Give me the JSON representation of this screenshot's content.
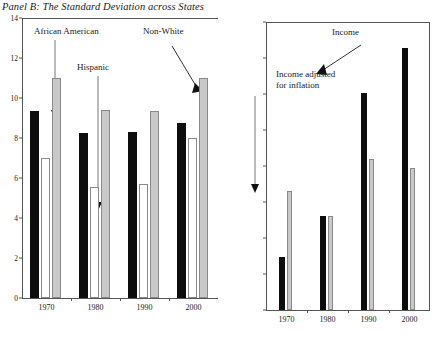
{
  "panels": {
    "left": {
      "title": "Panel B: The Standard Deviation across States",
      "annotations": {
        "african_american": "African American",
        "hispanic": "Hispanic",
        "non_white": "Non-White"
      }
    },
    "right": {
      "annotations": {
        "income": "Income",
        "income_adjusted_l1": "Income adjusted",
        "income_adjusted_l2": "for inflation"
      }
    }
  },
  "chart_data": [
    {
      "type": "bar",
      "title": "Panel B: The Standard Deviation across States",
      "xlabel": "",
      "ylabel": "",
      "ylim": [
        0,
        14
      ],
      "yticks": [
        0,
        2,
        4,
        6,
        8,
        10,
        12,
        14
      ],
      "ytick_labels": [
        "0",
        "2",
        "4",
        "6",
        "8",
        "10",
        "12",
        "14"
      ],
      "grid": false,
      "legend": "annotated-arrows",
      "categories": [
        "1970",
        "1980",
        "1990",
        "2000"
      ],
      "series": [
        {
          "name": "African American",
          "color": "#0d0d0d",
          "values": [
            9.35,
            8.25,
            8.3,
            8.75
          ]
        },
        {
          "name": "Hispanic",
          "color": "#ffffff",
          "values": [
            7.0,
            5.55,
            5.7,
            8.0
          ]
        },
        {
          "name": "Non-White",
          "color": "#c9c9c9",
          "values": [
            11.0,
            9.4,
            9.35,
            11.0
          ]
        }
      ]
    },
    {
      "type": "bar",
      "title": "",
      "xlabel": "",
      "ylabel": "",
      "ylim": [
        0,
        8000
      ],
      "yticks": [
        0,
        1000,
        2000,
        3000,
        4000,
        5000,
        6000,
        7000,
        8000
      ],
      "ytick_labels": [
        "$-",
        "$1,000",
        "$2,000",
        "$3,000",
        "$4,000",
        "$5,000",
        "$6,000",
        "$7,000",
        "$8,000"
      ],
      "grid": false,
      "legend": "annotated-arrows",
      "categories": [
        "1970",
        "1980",
        "1990",
        "2000"
      ],
      "series": [
        {
          "name": "Income",
          "color": "#0d0d0d",
          "values": [
            1480,
            2620,
            6030,
            7270
          ]
        },
        {
          "name": "Income adjusted for inflation",
          "color": "#c9c9c9",
          "values": [
            3300,
            2610,
            4200,
            3950
          ]
        }
      ]
    }
  ]
}
